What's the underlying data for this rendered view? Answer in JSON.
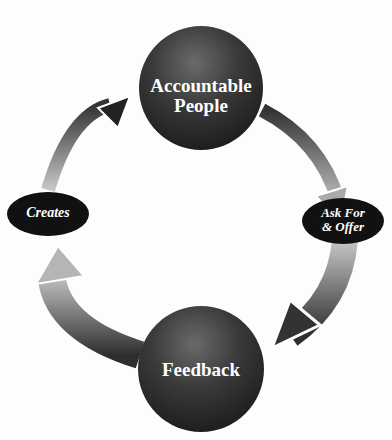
{
  "diagram": {
    "type": "cycle",
    "nodes": [
      {
        "id": "accountable",
        "label_line1": "Accountable",
        "label_line2": "People",
        "shape": "sphere"
      },
      {
        "id": "feedback",
        "label": "Feedback",
        "shape": "sphere"
      }
    ],
    "connectors": [
      {
        "id": "ask",
        "label_line1": "Ask For",
        "label_line2": "& Offer",
        "shape": "ellipse"
      },
      {
        "id": "creates",
        "label": "Creates",
        "shape": "ellipse"
      }
    ],
    "flow": [
      "Accountable People",
      "Ask For & Offer",
      "Feedback",
      "Creates",
      "Accountable People"
    ],
    "colors": {
      "sphere": "#2e2e2e",
      "ellipse": "#111111",
      "arrow_dark": "#3a3a3a",
      "arrow_light": "#b5b5b5",
      "background": "#fdfdfd"
    }
  }
}
